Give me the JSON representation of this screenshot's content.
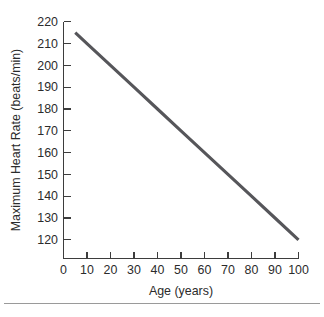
{
  "chart_data": {
    "type": "line",
    "title": "",
    "xlabel": "Age (years)",
    "ylabel": "Maximum Heart Rate (beats/min)",
    "xlim": [
      0,
      100
    ],
    "ylim": [
      110,
      220
    ],
    "xticks": [
      0,
      10,
      20,
      30,
      40,
      50,
      60,
      70,
      80,
      90,
      100
    ],
    "xtick_labels": [
      "0",
      "10",
      "20",
      "30",
      "40",
      "50",
      "60",
      "70",
      "80",
      "90",
      "100"
    ],
    "yticks": [
      120,
      130,
      140,
      150,
      160,
      170,
      180,
      190,
      200,
      210,
      220
    ],
    "ytick_labels": [
      "120",
      "130",
      "140",
      "150",
      "160",
      "170",
      "180",
      "190",
      "200",
      "210",
      "220"
    ],
    "grid": false,
    "legend": false,
    "series": [
      {
        "name": "Maximum Heart Rate",
        "color": "#56565a",
        "x": [
          5,
          100
        ],
        "values": [
          215,
          120
        ],
        "points": [
          {
            "x": 5,
            "y": 215
          },
          {
            "x": 10,
            "y": 210
          },
          {
            "x": 20,
            "y": 200
          },
          {
            "x": 30,
            "y": 190
          },
          {
            "x": 40,
            "y": 180
          },
          {
            "x": 50,
            "y": 170
          },
          {
            "x": 60,
            "y": 160
          },
          {
            "x": 70,
            "y": 150
          },
          {
            "x": 80,
            "y": 140
          },
          {
            "x": 90,
            "y": 130
          },
          {
            "x": 100,
            "y": 120
          }
        ]
      }
    ]
  },
  "figure": {
    "background_color": "#ffffff",
    "axis_color": "#3d3d3d",
    "footer_rule_color": "#9a9a9a"
  }
}
